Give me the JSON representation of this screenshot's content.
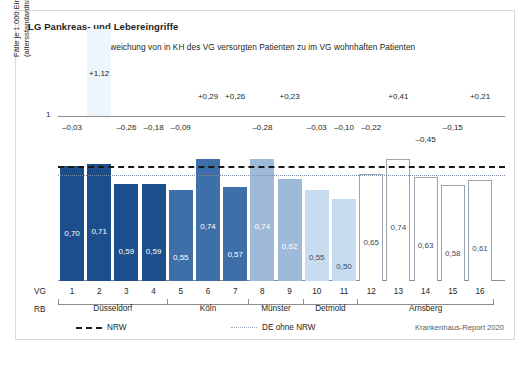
{
  "chart_data": {
    "type": "bar",
    "title": "LG Pankreas- und Lebereingriffe",
    "subtitle": "Abweichung von in KH des VG versorgten Patienten zu im VG wohnhaften Patienten",
    "ylabel_line1": "Fälle je 1.000 Einwohner",
    "ylabel_line2": "(altersstandardisiert)",
    "xlabel_vg": "VG",
    "xlabel_rb": "RB",
    "ytick_label": "1",
    "ylim": [
      0,
      1.0
    ],
    "grid": false,
    "categories": [
      "1",
      "2",
      "3",
      "4",
      "5",
      "6",
      "7",
      "8",
      "9",
      "10",
      "11",
      "12",
      "13",
      "14",
      "15",
      "16"
    ],
    "values": [
      0.7,
      0.71,
      0.59,
      0.59,
      0.55,
      0.74,
      0.57,
      0.74,
      0.62,
      0.55,
      0.5,
      0.65,
      0.74,
      0.63,
      0.58,
      0.61
    ],
    "value_labels": [
      "0,70",
      "0,71",
      "0,59",
      "0,59",
      "0,55",
      "0,74",
      "0,57",
      "0,74",
      "0,62",
      "0,55",
      "0,50",
      "0,65",
      "0,74",
      "0,63",
      "0,58",
      "0,61"
    ],
    "deviation_labels": [
      "–0,03",
      "+1,12",
      "–0,26",
      "–0,18",
      "–0,09",
      "+0,29",
      "+0,26",
      "–0,28",
      "+0,23",
      "–0,03",
      "–0,10",
      "–0,22",
      "+0,41",
      "–0,45",
      "–0,15",
      "+0,21"
    ],
    "deviations": [
      -0.03,
      1.12,
      -0.26,
      -0.18,
      -0.09,
      0.29,
      0.26,
      -0.28,
      0.23,
      -0.03,
      -0.1,
      -0.22,
      0.41,
      -0.45,
      -0.15,
      0.21
    ],
    "bar_colors": [
      "#1c4e8c",
      "#1c4e8c",
      "#1c4e8c",
      "#1c4e8c",
      "#3f6fa8",
      "#3f6fa8",
      "#3f6fa8",
      "#9fbad9",
      "#9fbad9",
      "#c8dcef",
      "#c8dcef",
      "#ffffff",
      "#ffffff",
      "#ffffff",
      "#ffffff",
      "#ffffff"
    ],
    "bar_outlined": [
      false,
      false,
      false,
      false,
      false,
      false,
      false,
      false,
      false,
      false,
      false,
      true,
      true,
      true,
      true,
      true
    ],
    "label_colors": [
      "#ffffff",
      "#ffffff",
      "#ffffff",
      "#ffffff",
      "#ffffff",
      "#ffffff",
      "#ffffff",
      "#ffffff",
      "#ffffff",
      "#3a4a5c",
      "#3a4a5c",
      "#3a4a5c",
      "#3a4a5c",
      "#3a4a5c",
      "#3a4a5c",
      "#3a4a5c"
    ],
    "highlight_index": 1,
    "reference_lines": [
      {
        "name": "NRW",
        "value": 0.695,
        "style": "dashed",
        "color": "#1a1a1a"
      },
      {
        "name": "DE ohne NRW",
        "value": 0.645,
        "style": "dotted",
        "color": "#7d8fa8"
      }
    ],
    "groups": [
      {
        "label": "Düsseldorf",
        "from": 0,
        "to": 3
      },
      {
        "label": "Köln",
        "from": 4,
        "to": 6
      },
      {
        "label": "Münster",
        "from": 7,
        "to": 8
      },
      {
        "label": "Detmold",
        "from": 9,
        "to": 10
      },
      {
        "label": "Arnsberg",
        "from": 11,
        "to": 15
      }
    ],
    "legend": [
      {
        "label": "NRW",
        "style": "dashed"
      },
      {
        "label": "DE ohne NRW",
        "style": "dotted"
      }
    ],
    "legend_position": "bottom-left",
    "source": "Krankenhaus-Report 2020"
  }
}
